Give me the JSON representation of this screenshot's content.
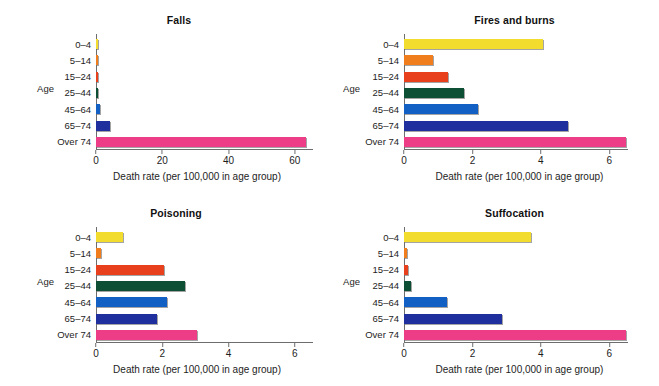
{
  "figure": {
    "categories": [
      "0–4",
      "5–14",
      "15–24",
      "25–44",
      "45–64",
      "65–74",
      "Over 74"
    ],
    "y_axis_name": "Age",
    "x_axis_label": "Death rate (per 100,000 in age group)",
    "colors": {
      "0–4": "#f2dc2e",
      "5–14": "#f07e1c",
      "15–24": "#e8401c",
      "25–44": "#0c4f34",
      "45–64": "#1260c4",
      "65–74": "#1f2f9e",
      "Over 74": "#ed3d87",
      "axis": "#6d6d6d"
    }
  },
  "panels": [
    {
      "id": "falls",
      "title": "Falls",
      "xticks": [
        "0",
        "20",
        "40",
        "60"
      ],
      "xtick_values": [
        0,
        20,
        40,
        60
      ],
      "values": [
        0.3,
        0.2,
        0.35,
        0.6,
        1.3,
        4.2,
        63.5
      ]
    },
    {
      "id": "fires",
      "title": "Fires and burns",
      "xticks": [
        "0",
        "2",
        "4",
        "6"
      ],
      "xtick_values": [
        0,
        2,
        4,
        6
      ],
      "values": [
        4.05,
        0.85,
        1.3,
        1.75,
        2.15,
        4.8,
        6.55
      ]
    },
    {
      "id": "poisoning",
      "title": "Poisoning",
      "xticks": [
        "0",
        "2",
        "4",
        "6"
      ],
      "xtick_values": [
        0,
        2,
        4,
        6
      ],
      "values": [
        0.8,
        0.15,
        2.05,
        2.7,
        2.15,
        1.85,
        3.05
      ]
    },
    {
      "id": "suffocation",
      "title": "Suffocation",
      "xticks": [
        "0",
        "2",
        "4",
        "6"
      ],
      "xtick_values": [
        0,
        2,
        4,
        6
      ],
      "values": [
        3.7,
        0.08,
        0.12,
        0.2,
        1.25,
        2.85,
        6.5
      ]
    }
  ],
  "chart_data": {
    "type": "bar",
    "orientation": "horizontal",
    "xlabel": "Death rate (per 100,000 in age group)",
    "ylabel": "Age",
    "grid": false,
    "legend": "none",
    "categories": [
      "0–4",
      "5–14",
      "15–24",
      "25–44",
      "45–64",
      "65–74",
      "Over 74"
    ],
    "panels": [
      {
        "title": "Falls",
        "xlim": [
          0,
          65
        ],
        "xticks": [
          0,
          20,
          40,
          60
        ],
        "values": [
          0.3,
          0.2,
          0.35,
          0.6,
          1.3,
          4.2,
          63.5
        ]
      },
      {
        "title": "Fires and burns",
        "xlim": [
          0,
          6.8
        ],
        "xticks": [
          0,
          2,
          4,
          6
        ],
        "values": [
          4.05,
          0.85,
          1.3,
          1.75,
          2.15,
          4.8,
          6.55
        ]
      },
      {
        "title": "Poisoning",
        "xlim": [
          0,
          6.3
        ],
        "xticks": [
          0,
          2,
          4,
          6
        ],
        "values": [
          0.8,
          0.15,
          2.05,
          2.7,
          2.15,
          1.85,
          3.05
        ]
      },
      {
        "title": "Suffocation",
        "xlim": [
          0,
          6.8
        ],
        "xticks": [
          0,
          2,
          4,
          6
        ],
        "values": [
          3.7,
          0.08,
          0.12,
          0.2,
          1.25,
          2.85,
          6.5
        ]
      }
    ]
  }
}
